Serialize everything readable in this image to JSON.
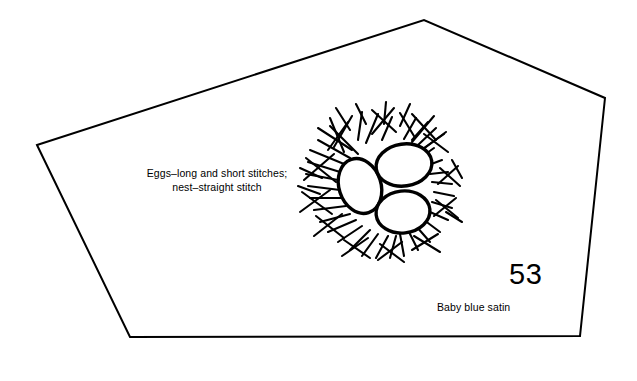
{
  "plate": {
    "number": "53",
    "stitch_caption_line1": "Eggs–long and short stitches;",
    "stitch_caption_line2": "nest–straight stitch",
    "fabric_caption": "Baby blue satin",
    "ink_color": "#000000",
    "background_color": "#ffffff"
  },
  "outline": {
    "shape": "pentagon",
    "points": "37,145 424,20 605,98 580,336 130,337",
    "stroke_width": 2
  },
  "illustration": {
    "name": "birds-nest-with-three-eggs",
    "center_x": 382,
    "center_y": 186,
    "eggs": [
      {
        "name": "egg-left",
        "cx": 360,
        "cy": 186,
        "rx": 21,
        "ry": 28,
        "rotation": -18
      },
      {
        "name": "egg-upper-right",
        "cx": 404,
        "cy": 165,
        "rx": 28,
        "ry": 21,
        "rotation": -8
      },
      {
        "name": "egg-lower-right",
        "cx": 403,
        "cy": 212,
        "rx": 27,
        "ry": 21,
        "rotation": -6
      }
    ],
    "nest_strokes": [
      "318,128 352,150",
      "330,118 344,152",
      "352,116 334,147",
      "362,112 358,140",
      "378,114 366,143",
      "392,117 382,140",
      "400,113 414,136",
      "416,118 404,139",
      "428,122 412,140",
      "436,128 418,145",
      "444,134 424,148",
      "318,140 350,158",
      "310,150 344,164",
      "308,162 340,172",
      "306,174 338,180",
      "308,186 340,190",
      "310,198 342,198",
      "314,210 346,206",
      "320,222 350,214",
      "328,232 356,220",
      "338,242 362,226",
      "350,250 370,230",
      "362,256 378,234",
      "376,258 388,236",
      "390,258 396,236",
      "404,256 400,234",
      "418,250 408,230",
      "430,242 416,226",
      "440,232 424,220",
      "448,220 430,212",
      "452,208 432,202",
      "454,196 434,192",
      "452,184 432,182",
      "448,172 430,174",
      "442,160 426,166",
      "434,148 420,158",
      "330,126 358,154",
      "348,122 328,150",
      "372,110 396,132",
      "394,108 372,134",
      "412,114 436,140",
      "434,116 412,142",
      "306,158 336,182",
      "334,154 304,180",
      "302,192 332,214",
      "330,190 300,212",
      "316,216 344,238",
      "342,214 314,236",
      "344,240 370,258",
      "368,238 342,256",
      "380,244 404,262",
      "402,242 378,260",
      "414,236 440,252",
      "438,234 412,250",
      "436,200 458,218",
      "456,198 434,216",
      "440,168 460,186",
      "458,166 438,184",
      "424,134 448,152",
      "446,132 422,150",
      "356,104 366,124",
      "386,102 384,124",
      "410,104 400,126",
      "336,108 350,130",
      "300,168 322,178",
      "298,186 320,194",
      "452,160 462,178",
      "446,212 462,222"
    ]
  }
}
